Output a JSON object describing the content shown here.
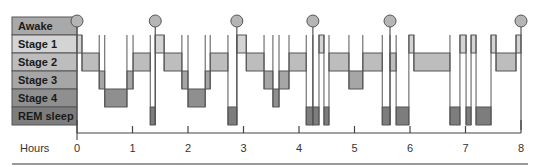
{
  "chart_data": {
    "type": "hypnogram",
    "title": "",
    "xlabel": "Hours",
    "ylabel": "",
    "xlim": [
      0,
      8
    ],
    "x_ticks": [
      0,
      1,
      2,
      3,
      4,
      5,
      6,
      7,
      8
    ],
    "x_tick_labels": [
      "0",
      "1",
      "2",
      "3",
      "4",
      "5",
      "6",
      "7",
      "8"
    ],
    "stages": [
      {
        "key": "awake",
        "label": "Awake",
        "color": "#a9a9a9"
      },
      {
        "key": "s1",
        "label": "Stage 1",
        "color": "#d4d4d4"
      },
      {
        "key": "s2",
        "label": "Stage 2",
        "color": "#bdbdbd"
      },
      {
        "key": "s3",
        "label": "Stage 3",
        "color": "#a6a6a6"
      },
      {
        "key": "s4",
        "label": "Stage 4",
        "color": "#8f8f8f"
      },
      {
        "key": "rem",
        "label": "REM sleep",
        "color": "#7d7d7d"
      }
    ],
    "segments": [
      {
        "stage": "s1",
        "start": 0.0,
        "end": 0.09
      },
      {
        "stage": "s2",
        "start": 0.09,
        "end": 0.4
      },
      {
        "stage": "s3",
        "start": 0.4,
        "end": 0.5
      },
      {
        "stage": "s4",
        "start": 0.5,
        "end": 0.9
      },
      {
        "stage": "s3",
        "start": 0.9,
        "end": 1.01
      },
      {
        "stage": "s2",
        "start": 1.01,
        "end": 1.32
      },
      {
        "stage": "rem",
        "start": 1.32,
        "end": 1.41
      },
      {
        "stage": "s1",
        "start": 1.41,
        "end": 1.57
      },
      {
        "stage": "s2",
        "start": 1.57,
        "end": 1.89
      },
      {
        "stage": "s3",
        "start": 1.89,
        "end": 2.0
      },
      {
        "stage": "s4",
        "start": 2.0,
        "end": 2.31
      },
      {
        "stage": "s3",
        "start": 2.31,
        "end": 2.4
      },
      {
        "stage": "s2",
        "start": 2.4,
        "end": 2.72
      },
      {
        "stage": "rem",
        "start": 2.72,
        "end": 2.88
      },
      {
        "stage": "s1",
        "start": 2.88,
        "end": 3.05
      },
      {
        "stage": "s2",
        "start": 3.05,
        "end": 3.37
      },
      {
        "stage": "s3",
        "start": 3.37,
        "end": 3.53
      },
      {
        "stage": "s4",
        "start": 3.53,
        "end": 3.64
      },
      {
        "stage": "s3",
        "start": 3.64,
        "end": 3.82
      },
      {
        "stage": "s2",
        "start": 3.82,
        "end": 4.13
      },
      {
        "stage": "rem",
        "start": 4.13,
        "end": 4.25
      },
      {
        "stage": "rem",
        "start": 4.25,
        "end": 4.36
      },
      {
        "stage": "s1",
        "start": 4.36,
        "end": 4.45
      },
      {
        "stage": "rem",
        "start": 4.45,
        "end": 4.54
      },
      {
        "stage": "s2",
        "start": 4.54,
        "end": 4.9
      },
      {
        "stage": "s3",
        "start": 4.9,
        "end": 5.15
      },
      {
        "stage": "s2",
        "start": 5.15,
        "end": 5.5
      },
      {
        "stage": "rem",
        "start": 5.5,
        "end": 5.64
      },
      {
        "stage": "s2",
        "start": 5.64,
        "end": 5.75
      },
      {
        "stage": "rem",
        "start": 5.75,
        "end": 5.98
      },
      {
        "stage": "s1",
        "start": 5.98,
        "end": 6.07
      },
      {
        "stage": "s2",
        "start": 6.07,
        "end": 6.72
      },
      {
        "stage": "rem",
        "start": 6.72,
        "end": 6.9
      },
      {
        "stage": "s1",
        "start": 6.9,
        "end": 7.01
      },
      {
        "stage": "rem",
        "start": 7.01,
        "end": 7.1
      },
      {
        "stage": "s1",
        "start": 7.1,
        "end": 7.19
      },
      {
        "stage": "rem",
        "start": 7.19,
        "end": 7.46
      },
      {
        "stage": "s1",
        "start": 7.46,
        "end": 7.55
      },
      {
        "stage": "s2",
        "start": 7.55,
        "end": 7.91
      },
      {
        "stage": "s1",
        "start": 7.91,
        "end": 8.0
      }
    ],
    "awakenings": [
      0.0,
      1.41,
      2.88,
      4.25,
      5.64,
      8.0
    ],
    "grid": false,
    "legend": "none"
  },
  "colors": {
    "outline": "#555555",
    "axis": "#444444",
    "awake_marker_fill": "#b5b5b5",
    "bottom_rule": "#777777"
  }
}
